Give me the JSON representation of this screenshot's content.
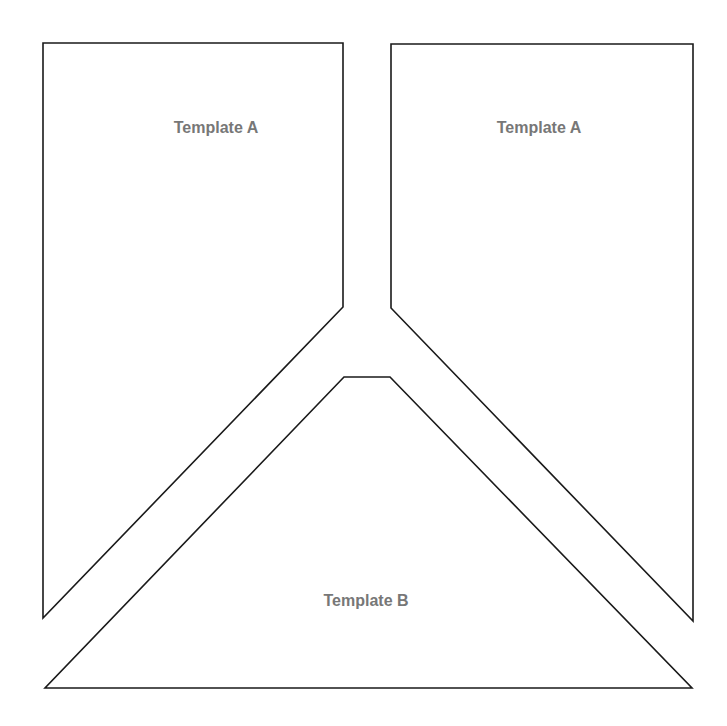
{
  "diagram": {
    "colors": {
      "stroke": "#1a1a1a",
      "label": "#777777",
      "background": "#ffffff"
    },
    "shapes": [
      {
        "id": "left-pentagon",
        "label": "Template A",
        "points": "43,43 343,43 343,307 43,618",
        "label_x": 216,
        "label_y": 133
      },
      {
        "id": "right-pentagon",
        "label": "Template A",
        "points": "391,44 693,44 693,621 391,308",
        "label_x": 539,
        "label_y": 133
      },
      {
        "id": "bottom-trapezoid",
        "label": "Template B",
        "points": "344,377 390,377 692,688 45,688",
        "label_x": 366,
        "label_y": 606
      }
    ]
  }
}
